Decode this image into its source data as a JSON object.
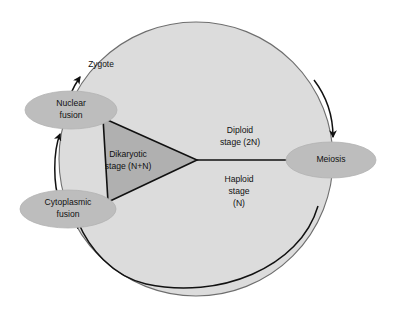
{
  "figure": {
    "background_color": "#ffffff"
  },
  "colors": {
    "cycle_circle_fill": "#dcdcdc",
    "cycle_circle_stroke": "#6e6e6e",
    "dikaryotic_wedge_fill": "#b0b0b0",
    "dikaryotic_wedge_stroke": "#111111",
    "ellipse_fill": "#bdbdbd",
    "ellipse_stroke": "#b0b0b0",
    "line_color": "#111111",
    "text_color": "#111111"
  },
  "nodes": {
    "nuclear_fusion": {
      "label_line1": "Nuclear",
      "label_line2": "fusion"
    },
    "cytoplasmic_fusion": {
      "label_line1": "Cytoplasmic",
      "label_line2": "fusion"
    },
    "meiosis": {
      "label": "Meiosis"
    }
  },
  "stages": {
    "dikaryotic": {
      "label_line1": "Dikaryotic",
      "label_line2": "stage (N+N)"
    },
    "diploid": {
      "label_line1": "Diploid",
      "label_line2": "stage (2N)"
    },
    "haploid": {
      "label_line1": "Haploid",
      "label_line2": "stage",
      "label_line3": "(N)"
    }
  },
  "annotations": {
    "zygote": {
      "label": "Zygote"
    }
  }
}
